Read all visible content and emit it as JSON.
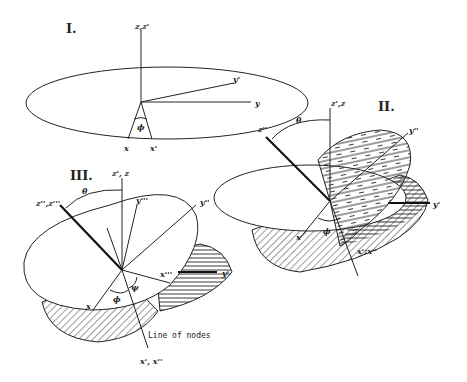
{
  "diagram": {
    "type": "euler-angle-rotations",
    "panels": [
      {
        "id": "I",
        "numeral": "I.",
        "labels": {
          "z_axis": "z,z'",
          "y_prime": "y'",
          "y": "y",
          "x": "x",
          "x_prime": "x'",
          "angle": "ϕ"
        }
      },
      {
        "id": "II",
        "numeral": "II.",
        "labels": {
          "z_axis": "z',z",
          "z_double": "z''",
          "theta": "θ",
          "y_double": "y''",
          "y_prime": "y'",
          "x": "x",
          "phi": "ϕ",
          "line_of_nodes": "x';x''"
        }
      },
      {
        "id": "III",
        "numeral": "III.",
        "labels": {
          "z_axis": "z', z",
          "z_rot": "z'',z'''",
          "theta": "θ",
          "y_triple": "y'''",
          "y_double": "y''",
          "x_triple": "x'''",
          "y_prime": "y'",
          "x": "x",
          "phi": "ϕ",
          "psi": "ψ",
          "line_of_nodes_label": "Line of nodes",
          "line_of_nodes": "x', x''"
        }
      }
    ]
  }
}
